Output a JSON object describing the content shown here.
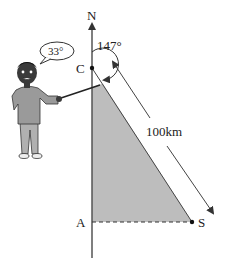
{
  "diagram": {
    "north_label": "N",
    "point_c_label": "C",
    "point_a_label": "A",
    "point_s_label": "S",
    "bearing_label": "147°",
    "distance_label": "100km",
    "speech_bubble_text": "33°",
    "colors": {
      "shade": "#bdbdbd",
      "line": "#444444",
      "skin": "#3a3a3a",
      "shirt": "#9a9a9a",
      "pants": "#b0b0b0"
    }
  }
}
